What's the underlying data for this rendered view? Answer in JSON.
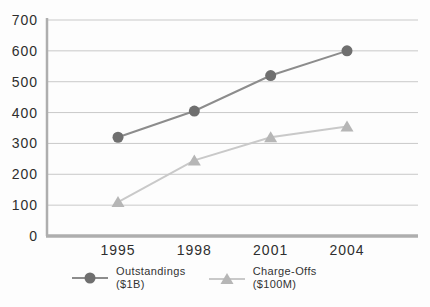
{
  "chart_data": {
    "type": "line",
    "categories": [
      "1995",
      "1998",
      "2001",
      "2004"
    ],
    "series": [
      {
        "name": "Outstandings ($1B)",
        "legend_lines": [
          "Outstandings",
          "($1B)"
        ],
        "marker": "circle",
        "marker_color": "#6f6f6f",
        "line_color": "#8c8c8c",
        "values": [
          320,
          405,
          520,
          600
        ]
      },
      {
        "name": "Charge-Offs ($100M)",
        "legend_lines": [
          "Charge-Offs",
          "($100M)"
        ],
        "marker": "triangle",
        "marker_color": "#b6b6b6",
        "line_color": "#c9c9c9",
        "values": [
          110,
          245,
          320,
          355
        ]
      }
    ],
    "title": "",
    "xlabel": "",
    "ylabel": "",
    "ylim": [
      0,
      700
    ],
    "yticks": [
      0,
      100,
      200,
      300,
      400,
      500,
      600,
      700
    ],
    "grid": true,
    "legend_position": "bottom"
  },
  "colors": {
    "background": "#fdfdfd",
    "grid": "#c9c9c9",
    "axis": "#aeaeae",
    "text": "#2e2e2e"
  }
}
